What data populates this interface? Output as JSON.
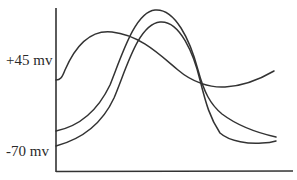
{
  "diagram": {
    "type": "action-potential-waveforms",
    "y_labels": {
      "upper": "+45 mv",
      "lower": "-70 mv"
    },
    "curves": [
      {
        "name": "broad-curve",
        "description": "starts near +45 mv level, broad early peak, shallow trough, rises at end"
      },
      {
        "name": "tall-curve",
        "description": "starts above -70 mv, tall sharp peak, falls below baseline"
      },
      {
        "name": "second-tall-curve",
        "description": "starts at -70 mv, tall peak slightly later, falls below baseline"
      }
    ],
    "colors": {
      "line": "#333333",
      "background": "#ffffff"
    }
  }
}
